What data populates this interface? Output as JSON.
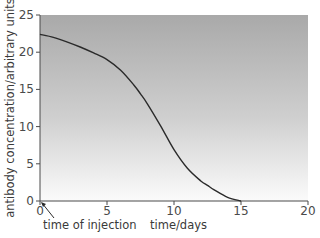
{
  "chart_data": {
    "type": "line",
    "title": "",
    "xlabel": "time/days",
    "ylabel": "antibody concentration/arbitrary units",
    "xlim": [
      0,
      20
    ],
    "ylim": [
      0,
      25
    ],
    "x_ticks": [
      0,
      5,
      10,
      15,
      20
    ],
    "y_ticks": [
      0,
      5,
      10,
      15,
      20,
      25
    ],
    "grid": false,
    "legend": null,
    "background": "vertical gray gradient, darker at top",
    "series": [
      {
        "name": "antibody concentration",
        "color": "#2a2a2a",
        "x": [
          0,
          1,
          2,
          3,
          4,
          5,
          6,
          7,
          7.5,
          8,
          9,
          10,
          11,
          12,
          12.5,
          13,
          14,
          15
        ],
        "y": [
          22.4,
          22.0,
          21.4,
          20.7,
          19.9,
          19.0,
          17.6,
          15.6,
          14.4,
          13.1,
          10.1,
          6.9,
          4.4,
          2.7,
          2.1,
          1.5,
          0.5,
          0
        ]
      }
    ],
    "annotations": [
      {
        "text": "time of injection",
        "points_to": [
          0,
          0
        ]
      }
    ]
  },
  "labels": {
    "xlabel": "time/days",
    "ylabel": "antibody concentration/arbitrary units",
    "annotation": "time of injection",
    "x_ticks": [
      "0",
      "5",
      "10",
      "15",
      "20"
    ],
    "y_ticks": [
      "0",
      "5",
      "10",
      "15",
      "20",
      "25"
    ]
  },
  "colors": {
    "gradient_top": "#a9a9a9",
    "gradient_bottom": "#fbfbfb",
    "curve": "#2a2a2a",
    "axis": "#4a4a4a"
  }
}
